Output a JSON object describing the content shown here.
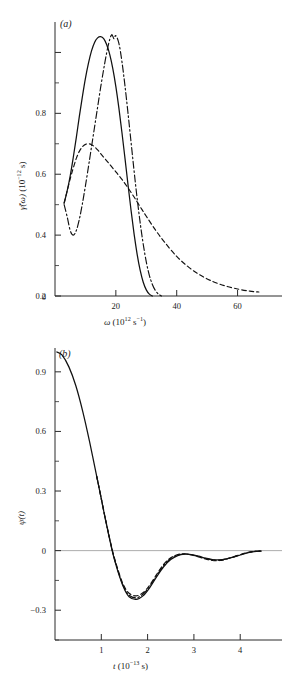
{
  "figure": {
    "panels": [
      {
        "id": "a",
        "label": "(a)",
        "xlabel_main": "ω",
        "xlabel_units": "(10",
        "xlabel_exp": "12",
        "xlabel_units_tail": " s",
        "xlabel_exp2": "−1",
        "xlabel_close": ")",
        "ylabel_main": "γ̃(ω)",
        "ylabel_units": "(10",
        "ylabel_exp": "−12",
        "ylabel_units_tail": " s)",
        "xticks": [
          "20",
          "40",
          "60"
        ],
        "yticks": [
          "0",
          "0.2",
          "0.4",
          "0.6",
          "0.8"
        ]
      },
      {
        "id": "b",
        "label": "(b)",
        "xlabel_main": "t",
        "xlabel_units": "(10",
        "xlabel_exp": "−13",
        "xlabel_units_tail": " s)",
        "ylabel_main": "ψ(t)",
        "xticks": [
          "1",
          "2",
          "3",
          "4"
        ],
        "yticks": [
          "0.9",
          "0.6",
          "0.3",
          "0",
          "−0.3"
        ]
      }
    ]
  },
  "chart_data": [
    {
      "type": "line",
      "panel": "a",
      "title": "(a)",
      "xlabel": "ω (10^12 s^-1)",
      "ylabel": "γ̃(ω) (10^-12 s)",
      "xlim": [
        0,
        70
      ],
      "ylim": [
        0,
        0.9
      ],
      "xticks": [
        20,
        40,
        60
      ],
      "yticks": [
        0,
        0.2,
        0.4,
        0.6,
        0.8
      ],
      "grid": false,
      "legend": null,
      "series": [
        {
          "name": "solid",
          "style": "solid",
          "x": [
            3,
            4,
            5,
            6,
            7,
            8,
            9,
            10,
            11,
            12,
            13,
            14,
            15,
            16,
            17,
            18,
            19,
            20,
            21,
            22,
            23,
            24,
            25,
            26,
            27,
            28,
            29,
            30,
            31,
            32
          ],
          "y": [
            0.305,
            0.345,
            0.395,
            0.455,
            0.52,
            0.59,
            0.655,
            0.715,
            0.765,
            0.805,
            0.833,
            0.848,
            0.852,
            0.845,
            0.825,
            0.793,
            0.747,
            0.688,
            0.617,
            0.537,
            0.452,
            0.365,
            0.281,
            0.203,
            0.137,
            0.084,
            0.045,
            0.02,
            0.006,
            0.0
          ]
        },
        {
          "name": "dashed",
          "style": "dashed",
          "x": [
            3,
            4,
            5,
            6,
            7,
            8,
            9,
            10,
            11,
            12,
            13,
            14,
            15,
            16,
            17,
            18,
            20,
            22,
            24,
            26,
            28,
            30,
            33,
            36,
            40,
            44,
            48,
            52,
            56,
            60,
            64,
            67
          ],
          "y": [
            0.305,
            0.345,
            0.385,
            0.42,
            0.452,
            0.475,
            0.49,
            0.498,
            0.5,
            0.497,
            0.49,
            0.48,
            0.468,
            0.456,
            0.444,
            0.432,
            0.408,
            0.383,
            0.355,
            0.325,
            0.293,
            0.262,
            0.217,
            0.177,
            0.13,
            0.094,
            0.067,
            0.047,
            0.033,
            0.023,
            0.016,
            0.013
          ]
        },
        {
          "name": "dash-dot",
          "style": "dashdot",
          "x": [
            3,
            4,
            5,
            6,
            7,
            8,
            9,
            10,
            11,
            12,
            13,
            14,
            15,
            16,
            17,
            18,
            18.6,
            19,
            19.4,
            20,
            21,
            22,
            23,
            24,
            25,
            26,
            27,
            28,
            29,
            30,
            31,
            32,
            33,
            34,
            35
          ],
          "y": [
            0.3,
            0.26,
            0.215,
            0.2,
            0.215,
            0.252,
            0.303,
            0.362,
            0.425,
            0.49,
            0.555,
            0.62,
            0.685,
            0.745,
            0.8,
            0.843,
            0.858,
            0.853,
            0.845,
            0.855,
            0.83,
            0.77,
            0.69,
            0.6,
            0.505,
            0.41,
            0.32,
            0.24,
            0.17,
            0.112,
            0.068,
            0.038,
            0.018,
            0.006,
            0.0
          ]
        }
      ]
    },
    {
      "type": "line",
      "panel": "b",
      "title": "(b)",
      "xlabel": "t (10^-13 s)",
      "ylabel": "ψ(t)",
      "xlim": [
        0,
        4.6
      ],
      "ylim": [
        -0.45,
        1.02
      ],
      "xticks": [
        1,
        2,
        3,
        4
      ],
      "yticks": [
        0.9,
        0.6,
        0.3,
        0,
        -0.3
      ],
      "grid": false,
      "zero_line": true,
      "legend": null,
      "series": [
        {
          "name": "solid",
          "style": "solid",
          "x": [
            0.04,
            0.15,
            0.3,
            0.45,
            0.6,
            0.75,
            0.9,
            1.0,
            1.1,
            1.25,
            1.4,
            1.5,
            1.6,
            1.75,
            1.9,
            2.05,
            2.2,
            2.35,
            2.5,
            2.65,
            2.8,
            2.95,
            3.1,
            3.25,
            3.4,
            3.55,
            3.7,
            3.85,
            4.0,
            4.15,
            4.3,
            4.45
          ],
          "y": [
            1.0,
            0.985,
            0.925,
            0.83,
            0.7,
            0.545,
            0.375,
            0.26,
            0.145,
            -0.015,
            -0.135,
            -0.195,
            -0.232,
            -0.246,
            -0.228,
            -0.185,
            -0.13,
            -0.08,
            -0.045,
            -0.025,
            -0.018,
            -0.02,
            -0.028,
            -0.038,
            -0.045,
            -0.047,
            -0.042,
            -0.033,
            -0.022,
            -0.012,
            -0.005,
            -0.002
          ]
        },
        {
          "name": "dashed",
          "style": "dashed",
          "x": [
            0.9,
            1.0,
            1.1,
            1.25,
            1.4,
            1.5,
            1.6,
            1.75,
            1.9,
            2.05,
            2.2,
            2.35,
            2.5,
            2.65,
            2.8,
            2.95,
            3.1,
            3.25,
            3.4,
            3.55,
            3.7,
            3.85,
            4.0,
            4.15,
            4.3,
            4.45
          ],
          "y": [
            0.375,
            0.262,
            0.148,
            -0.008,
            -0.125,
            -0.182,
            -0.215,
            -0.228,
            -0.212,
            -0.172,
            -0.118,
            -0.068,
            -0.036,
            -0.02,
            -0.016,
            -0.022,
            -0.032,
            -0.042,
            -0.05,
            -0.05,
            -0.043,
            -0.032,
            -0.02,
            -0.01,
            -0.004,
            -0.002
          ]
        },
        {
          "name": "dash-dot",
          "style": "dashdot",
          "x": [
            0.9,
            1.0,
            1.1,
            1.25,
            1.4,
            1.5,
            1.6,
            1.75,
            1.9,
            2.05,
            2.2,
            2.35,
            2.5,
            2.65,
            2.8,
            2.95,
            3.1,
            3.25,
            3.4,
            3.55,
            3.7,
            3.85,
            4.0,
            4.15,
            4.3,
            4.45
          ],
          "y": [
            0.375,
            0.261,
            0.146,
            -0.012,
            -0.131,
            -0.19,
            -0.225,
            -0.238,
            -0.22,
            -0.178,
            -0.124,
            -0.074,
            -0.04,
            -0.022,
            -0.017,
            -0.021,
            -0.03,
            -0.04,
            -0.047,
            -0.048,
            -0.042,
            -0.032,
            -0.021,
            -0.011,
            -0.004,
            -0.002
          ]
        }
      ]
    }
  ]
}
